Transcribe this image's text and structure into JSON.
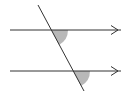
{
  "diagram": {
    "colors": {
      "line": "#333333",
      "angle_fill": "#b8b8b8",
      "background": "#ffffff"
    },
    "parallel_lines": [
      {
        "id": "top",
        "x1": 10,
        "y1": 30,
        "x2": 121,
        "y2": 30,
        "arrow": true
      },
      {
        "id": "bottom",
        "x1": 10,
        "y1": 71,
        "x2": 121,
        "y2": 71,
        "arrow": true
      }
    ],
    "transversal": {
      "x1": 38,
      "y1": 5,
      "x2": 84,
      "y2": 91
    },
    "shaded_angles": [
      {
        "id": "angle-top",
        "vertex": [
          51,
          30
        ],
        "position": "below-right"
      },
      {
        "id": "angle-bottom",
        "vertex": [
          73,
          71
        ],
        "position": "below-right"
      }
    ]
  }
}
